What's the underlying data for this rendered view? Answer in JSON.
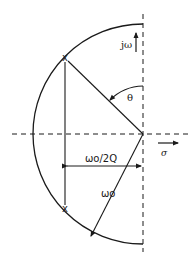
{
  "diagram": {
    "type": "s-plane pole plot",
    "labels": {
      "imag_axis": "jω",
      "real_axis": "σ",
      "angle": "θ",
      "real_part": "ωo/2Q",
      "radius": "ωo",
      "pole_marker": "x"
    },
    "geometry": {
      "origin": [
        143,
        134
      ],
      "radius": 110,
      "poles": [
        [
          65,
          58
        ],
        [
          65,
          209
        ]
      ]
    },
    "colors": {
      "stroke": "#1a1a1a",
      "background": "#ffffff"
    }
  }
}
